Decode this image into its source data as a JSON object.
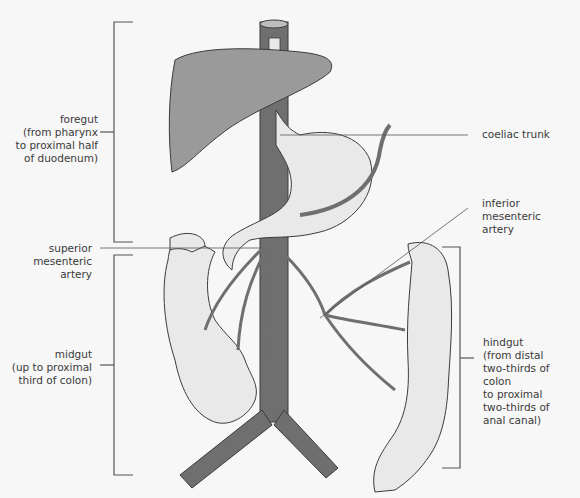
{
  "diagram": {
    "colors": {
      "background": "#f7f7f7",
      "vessel": "#6f6f6f",
      "vessel_outline": "#3c3c3c",
      "liver": "#9a9a9a",
      "gut": "#e9e9e9",
      "bracket": "#555555",
      "leader_line": "#555555",
      "text": "#3a3a3a"
    },
    "labels": {
      "foregut": "foregut\n(from pharynx\nto proximal half\nof duodenum)",
      "coeliac_trunk": "coeliac trunk",
      "inferior_mesenteric_artery": "inferior\nmesenteric\nartery",
      "superior_mesenteric_artery": "superior\nmesenteric\nartery",
      "midgut": "midgut\n(up to proximal\nthird of colon)",
      "hindgut": "hindgut\n(from distal\ntwo-thirds of colon\nto proximal\ntwo-thirds of\nanal canal)"
    },
    "structures": [
      "aorta",
      "liver",
      "stomach",
      "duodenum",
      "small intestine",
      "transverse colon",
      "ascending colon",
      "descending colon",
      "sigmoid colon",
      "common iliac arteries"
    ]
  }
}
